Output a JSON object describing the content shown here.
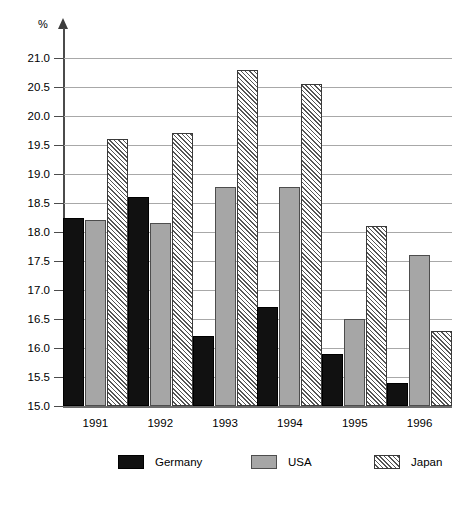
{
  "chart_data": {
    "type": "bar",
    "title": "",
    "xlabel": "",
    "ylabel": "%",
    "unit_label": "%",
    "categories": [
      "1991",
      "1992",
      "1993",
      "1994",
      "1995",
      "1996"
    ],
    "series": [
      {
        "name": "Germany",
        "color": "#111111",
        "fill": "solid-black",
        "values": [
          18.25,
          18.6,
          16.2,
          16.7,
          15.9,
          15.4
        ]
      },
      {
        "name": "USA",
        "color": "#a6a6a6",
        "fill": "solid-gray",
        "values": [
          18.2,
          18.15,
          18.77,
          18.77,
          16.5,
          17.6
        ]
      },
      {
        "name": "Japan",
        "color": "#ffffff",
        "fill": "diagonal-hatch",
        "values": [
          19.6,
          19.7,
          20.8,
          20.55,
          18.1,
          16.3
        ]
      }
    ],
    "ylim": [
      15.0,
      21.0
    ],
    "ytick_step": 0.5,
    "ytick_labels": [
      "21.0",
      "20.5",
      "20.0",
      "19.5",
      "19.0",
      "18.5",
      "18.0",
      "17.5",
      "17.0",
      "16.5",
      "16.0",
      "15.5",
      "15.0"
    ],
    "ytick_values": [
      21.0,
      20.5,
      20.0,
      19.5,
      19.0,
      18.5,
      18.0,
      17.5,
      17.0,
      16.5,
      16.0,
      15.5,
      15.0
    ],
    "grid": true,
    "legend_position": "bottom",
    "legend": [
      "Germany",
      "USA",
      "Japan"
    ]
  }
}
